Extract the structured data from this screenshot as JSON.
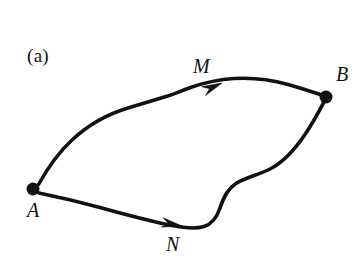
{
  "figure": {
    "panel_label": "(a)",
    "background_color": "#ffffff",
    "stroke_color": "#111111",
    "width": 364,
    "height": 269
  },
  "nodes": [
    {
      "id": "A",
      "label": "A",
      "x": 33,
      "y": 189,
      "radius": 6.5,
      "label_x": 27,
      "label_y": 200
    },
    {
      "id": "B",
      "label": "B",
      "x": 326,
      "y": 97,
      "radius": 6.5,
      "label_x": 336,
      "label_y": 64
    }
  ],
  "paths": [
    {
      "id": "M",
      "label": "M",
      "from": "A",
      "to": "B",
      "direction": "A-to-B",
      "description": "upper curved path from A to B with arrowhead near M",
      "arrow_tip_x": 222,
      "arrow_tip_y": 83,
      "label_x": 193,
      "label_y": 56
    },
    {
      "id": "N",
      "label": "N",
      "from": "A",
      "to": "B",
      "direction": "A-to-B",
      "description": "lower curved path from A to B with arrowhead near N",
      "arrow_tip_x": 182,
      "arrow_tip_y": 226,
      "label_x": 166,
      "label_y": 234
    }
  ],
  "geometry": {
    "upper_path_d": "M 38.5 184.5 C 46 171 58 153 72 140 C 88 125 108 114 128 108 C 146 102.5 158 99 166 96.5 C 176 93.5 183 90 192 87 C 205 82.5 219 79.5 234 78.5 C 252 77.4 272 80 288 84.5 C 303 88.7 314 92.5 321.5 95",
    "lower_path_d": "M 39 193 C 56 196.5 78 201.5 100 207.5 C 125 214.5 150 221 172 225.5 C 186 228.3 196 229 204 226.5 C 212 224 217 217 220 208 C 224 196 228 188.5 236 183.5 C 246 177.4 258 175 270 169 C 284 162 296 148 306 133 C 315 119.5 321 107.5 324.5 101",
    "upper_arrow_rotation_deg": -23,
    "lower_arrow_rotation_deg": 11
  }
}
